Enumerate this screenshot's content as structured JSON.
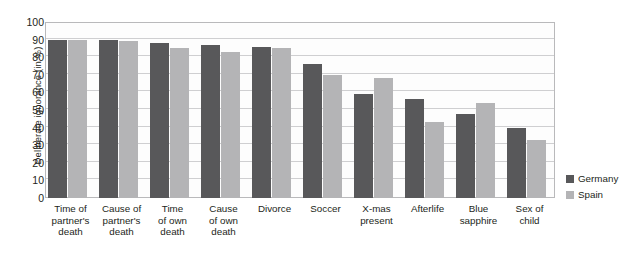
{
  "chart_data": {
    "type": "bar",
    "title": "",
    "xlabel": "",
    "ylabel": "Deliberate ignorance (in %)",
    "ylim": [
      0,
      100
    ],
    "ytick_step": 10,
    "yticks": [
      100,
      90,
      80,
      70,
      60,
      50,
      40,
      30,
      20,
      10,
      0
    ],
    "grid": true,
    "legend_position": "right",
    "categories": [
      "Time of\npartner's\ndeath",
      "Cause of\npartner's\ndeath",
      "Time\nof own\ndeath",
      "Cause\nof own\ndeath",
      "Divorce",
      "Soccer",
      "X-mas\npresent",
      "Afterlife",
      "Blue\nsapphire",
      "Sex of\nchild"
    ],
    "category_lines": [
      [
        "Time of",
        "partner's",
        "death"
      ],
      [
        "Cause of",
        "partner's",
        "death"
      ],
      [
        "Time",
        "of own",
        "death"
      ],
      [
        "Cause",
        "of own",
        "death"
      ],
      [
        "Divorce"
      ],
      [
        "Soccer"
      ],
      [
        "X-mas",
        "present"
      ],
      [
        "Afterlife"
      ],
      [
        "Blue",
        "sapphire"
      ],
      [
        "Sex of",
        "child"
      ]
    ],
    "series": [
      {
        "name": "Germany",
        "color": "#58585a",
        "values": [
          90,
          90,
          88,
          87,
          86,
          76,
          59,
          56,
          48,
          40
        ]
      },
      {
        "name": "Spain",
        "color": "#b4b4b6",
        "values": [
          90,
          89,
          85,
          83,
          85,
          70,
          68,
          43,
          54,
          33
        ]
      }
    ]
  },
  "legend": {
    "items": [
      {
        "label": "Germany",
        "color": "#58585a"
      },
      {
        "label": "Spain",
        "color": "#b4b4b6"
      }
    ]
  },
  "colors": {
    "germany": "#58585a",
    "spain": "#b4b4b6",
    "grid": "#cfcfd1",
    "axis": "#b9b9bb",
    "text": "#231f20",
    "plot_background": "#fdfdfd"
  }
}
